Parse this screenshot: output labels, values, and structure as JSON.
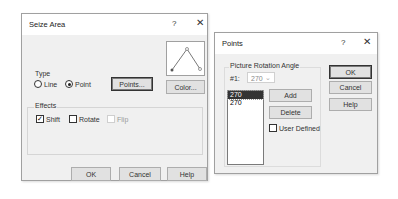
{
  "seize_area": {
    "title": "Seize Area",
    "help_glyph": "?",
    "close_glyph": "✕",
    "type_group": {
      "label": "Type",
      "options": [
        {
          "label": "Line",
          "selected": false
        },
        {
          "label": "Point",
          "selected": true
        }
      ],
      "points_button": "Points..."
    },
    "color_button": "Color...",
    "effects_group": {
      "label": "Effects",
      "checkboxes": [
        {
          "label": "Shift",
          "checked": true,
          "enabled": true,
          "glyph": "✓"
        },
        {
          "label": "Rotate",
          "checked": false,
          "enabled": true
        },
        {
          "label": "Flip",
          "checked": false,
          "enabled": false
        }
      ]
    },
    "buttons": {
      "ok": "OK",
      "cancel": "Cancel",
      "help": "Help"
    }
  },
  "points": {
    "title": "Points",
    "help_glyph": "?",
    "close_glyph": "✕",
    "group_label": "Picture Rotation Angle",
    "index_label": "#1:",
    "combo_value": "270",
    "combo_arrow": "⌄",
    "list_items": [
      {
        "label": "270",
        "selected": true
      },
      {
        "label": "270",
        "selected": false
      }
    ],
    "add_button": "Add",
    "delete_button": "Delete",
    "user_defined_label": "User Defined",
    "user_defined_checked": false,
    "buttons": {
      "ok": "OK",
      "cancel": "Cancel",
      "help": "Help"
    }
  }
}
